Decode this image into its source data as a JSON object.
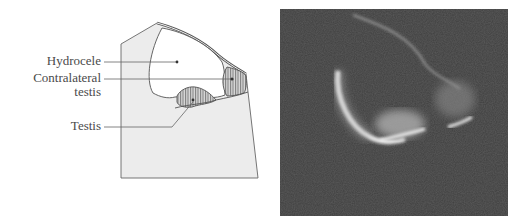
{
  "diagram": {
    "labels": {
      "hydrocele": "Hydrocele",
      "contralateral_line1": "Contralateral",
      "contralateral_line2": "testis",
      "testis": "Testis"
    },
    "colors": {
      "body_fill": "#ececec",
      "outline": "#555555",
      "hydrocele_fill": "#ffffff",
      "hatch": "#555555",
      "label_text": "#4a4a4a"
    }
  },
  "photo": {
    "description": "Grayscale ultrasound-like image of hydrocele with testis",
    "colors": {
      "background": "#3f3f3f",
      "echo": "#e8e8e8"
    }
  }
}
